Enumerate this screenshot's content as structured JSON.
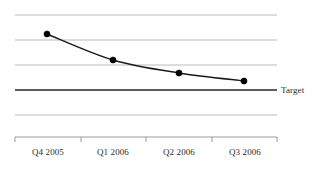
{
  "chart_data": {
    "type": "line",
    "title": "",
    "subtitle": "",
    "xlabel": "",
    "ylabel": "",
    "categories": [
      "Q4 2005",
      "Q1 2006",
      "Q2 2006",
      "Q3 2006"
    ],
    "series": [
      {
        "name": "Actual",
        "values": [
          4.0,
          3.0,
          2.5,
          2.2
        ],
        "marker": "filled-circle",
        "line_style": "smooth-curve"
      }
    ],
    "reference_lines": [
      {
        "name": "Target",
        "label": "Target",
        "value": 2.0,
        "style": "solid-dark"
      }
    ],
    "ylim": [
      0.5,
      5.0
    ],
    "y_gridline_values": [
      5.0,
      4.0,
      3.0,
      2.0,
      1.0
    ],
    "grid": true,
    "grid_orientation": "horizontal",
    "y_axis_visible": false,
    "y_tick_labels": [],
    "x_axis_visible": true,
    "legend": false,
    "legend_position": "inline-right",
    "annotations": [
      {
        "text": "Target",
        "x_px": 281,
        "y_px": 91
      }
    ]
  },
  "colors": {
    "background": "#ffffff",
    "gridline": "#b9b9b9",
    "target_line": "#272727",
    "series_line": "#1b1b1b",
    "marker_fill": "#000000",
    "axis_line": "#9a9a9a",
    "tick_mark": "#9a9a9a",
    "text": "#2b2b2b"
  },
  "geometry": {
    "width": 326,
    "height": 176,
    "plot_left": 15,
    "plot_right": 277,
    "gridline_y": [
      15,
      40,
      65,
      90,
      115
    ],
    "target_gridline_index": 3,
    "axis_y": 137,
    "tick_x": [
      15,
      81,
      146,
      212,
      277
    ],
    "tick_length": 5,
    "label_y": 155,
    "label_centers_x": [
      48,
      113,
      179,
      245
    ],
    "point_x": [
      47,
      113,
      179,
      244
    ],
    "point_y": [
      34,
      60,
      73,
      81
    ],
    "marker_radius": 3.1,
    "series_stroke_width": 1.5,
    "gridline_stroke_width": 1.0,
    "target_stroke_width": 1.5,
    "target_label_x": 281,
    "target_label_y": 93
  }
}
